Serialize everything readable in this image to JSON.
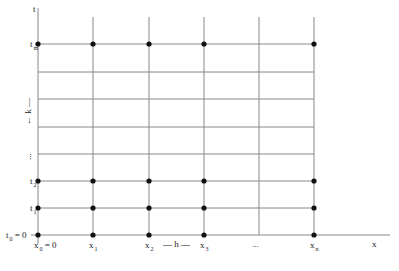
{
  "diagram": {
    "axis_x_label": "x",
    "axis_t_label": "t",
    "colors": {
      "line": "#888888",
      "dot": "#111111",
      "text": "#222222"
    },
    "columns_px": [
      38,
      93,
      149,
      204,
      259,
      314
    ],
    "rows_px": [
      44,
      72,
      99,
      127,
      154,
      181,
      208,
      235
    ],
    "row_labels": [
      {
        "base": "t",
        "sub": "m",
        "y": 44
      },
      {
        "base": "t",
        "sub": "2",
        "y": 181
      },
      {
        "base": "t",
        "sub": "1",
        "y": 208
      },
      {
        "base": "t",
        "sub": "0",
        "suffix": " = 0",
        "y": 235
      }
    ],
    "col_labels": [
      {
        "base": "x",
        "sub": "0",
        "suffix": " = 0",
        "x": 38
      },
      {
        "base": "x",
        "sub": "1",
        "x": 93
      },
      {
        "base": "x",
        "sub": "2",
        "x": 149
      },
      {
        "base": "x",
        "sub": "3",
        "x": 204
      },
      {
        "base": "x",
        "sub": "n",
        "x": 314
      }
    ],
    "h_label": "— h —",
    "k_label": "← k —",
    "x_ellipsis": "...",
    "t_ellipsis": "...",
    "dots": [
      [
        38,
        44
      ],
      [
        93,
        44
      ],
      [
        149,
        44
      ],
      [
        204,
        44
      ],
      [
        314,
        44
      ],
      [
        38,
        181
      ],
      [
        93,
        181
      ],
      [
        149,
        181
      ],
      [
        204,
        181
      ],
      [
        314,
        181
      ],
      [
        38,
        208
      ],
      [
        93,
        208
      ],
      [
        149,
        208
      ],
      [
        204,
        208
      ],
      [
        314,
        208
      ],
      [
        38,
        235
      ],
      [
        93,
        235
      ],
      [
        149,
        235
      ],
      [
        204,
        235
      ],
      [
        314,
        235
      ]
    ]
  }
}
